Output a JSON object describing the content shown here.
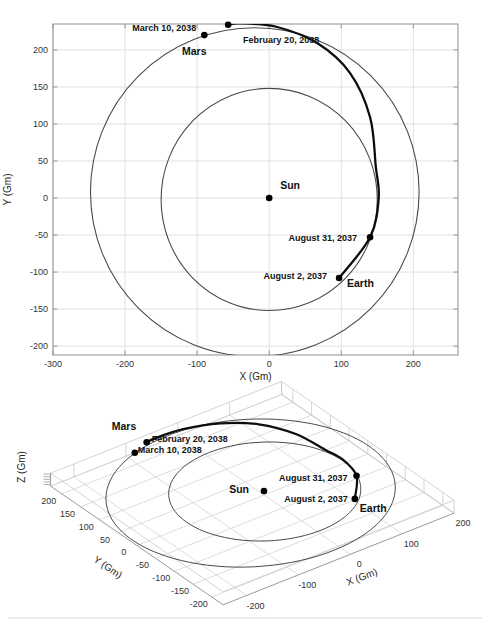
{
  "window": {
    "width": 490,
    "height": 625,
    "background": "#ffffff"
  },
  "colors": {
    "grid2d": "#dcdcdc",
    "axis2d": "#8f8f8f",
    "orbit": "#4a4a4a",
    "transfer": "#0d0d0d",
    "marker": "#000000",
    "grid3d": "#d4d4d4",
    "box3d_back": "#bdbdbd",
    "box3d_front": "#9a9a9a",
    "comb3d": "#c9c9c9",
    "page_shadow": "#e0e0e0"
  },
  "chart_data": [
    {
      "id": "orbit-plot-2d",
      "type": "line",
      "projection": "2d",
      "description": "Earth-to-Mars transfer trajectory, ecliptic plane view",
      "xlabel": "X (Gm)",
      "ylabel": "Y (Gm)",
      "xlim": [
        -300,
        262
      ],
      "ylim": [
        -212,
        235
      ],
      "xticks": [
        -300,
        -200,
        -100,
        0,
        100,
        200
      ],
      "yticks": [
        -200,
        -150,
        -100,
        -50,
        0,
        50,
        100,
        150,
        200
      ],
      "grid": true,
      "series": [
        {
          "name": "Earth orbit",
          "shape": "ellipse",
          "cx": 0,
          "cy": -2,
          "rx": 150,
          "ry": 150,
          "width": 1.1
        },
        {
          "name": "Mars orbit",
          "shape": "ellipse",
          "cx": -20,
          "cy": 8,
          "rx": 228,
          "ry": 222,
          "width": 1.1
        },
        {
          "name": "Transfer trajectory",
          "shape": "path",
          "width": 2.3,
          "points": [
            [
              97,
              -108
            ],
            [
              140,
              -53
            ],
            [
              152,
              0
            ],
            [
              148,
              42
            ],
            [
              140,
              109
            ],
            [
              112,
              169
            ],
            [
              67,
              209
            ],
            [
              11,
              231
            ],
            [
              -40,
              236
            ],
            [
              -57,
              234
            ]
          ]
        }
      ],
      "annotations": [
        {
          "label": "Sun",
          "x": 0,
          "y": 0,
          "marker": true,
          "anchor": "start",
          "dx": 11,
          "dy": -12,
          "cls": "planet-label"
        },
        {
          "label": "Earth",
          "x": 108,
          "y": -116,
          "marker": false,
          "anchor": "start",
          "dx": 0,
          "dy": 0,
          "cls": "planet-label"
        },
        {
          "label": "Mars",
          "x": -121,
          "y": 197,
          "marker": false,
          "anchor": "start",
          "dx": 0,
          "dy": 0,
          "cls": "planet-label"
        },
        {
          "label": "March 10, 2038",
          "x": -90,
          "y": 220,
          "marker": true,
          "anchor": "end",
          "dx": -8,
          "dy": -6,
          "cls": "date-label"
        },
        {
          "label": "February 20, 2038",
          "x": -57,
          "y": 234,
          "marker": true,
          "anchor": "start",
          "dx": 15,
          "dy": 16,
          "cls": "date-label"
        },
        {
          "label": "August 31, 2037",
          "x": 140,
          "y": -53,
          "marker": true,
          "anchor": "end",
          "dx": -13,
          "dy": 1,
          "cls": "date-label"
        },
        {
          "label": "August 2, 2037",
          "x": 97,
          "y": -108,
          "marker": true,
          "anchor": "end",
          "dx": -12,
          "dy": -1,
          "cls": "date-label"
        }
      ]
    },
    {
      "id": "orbit-plot-3d",
      "type": "line",
      "projection": "3d",
      "description": "Earth-to-Mars transfer trajectory, 3-D view",
      "xlabel": "X (Gm)",
      "ylabel": "Y (Gm)",
      "zlabel": "Z (Gm)",
      "xlim": [
        -245,
        200
      ],
      "ylim": [
        -230,
        230
      ],
      "xticks": [
        -200,
        -100,
        0,
        100,
        200
      ],
      "yticks": [
        -200,
        -150,
        -100,
        -50,
        0,
        50,
        100,
        150,
        200
      ],
      "grid": true,
      "series": [
        {
          "name": "Earth orbit",
          "shape": "ellipse",
          "cx": 0,
          "cy": -2,
          "rx": 150,
          "ry": 150,
          "width": 1.0
        },
        {
          "name": "Mars orbit",
          "shape": "ellipse",
          "cx": -20,
          "cy": 8,
          "rx": 228,
          "ry": 222,
          "width": 1.0
        },
        {
          "name": "Transfer trajectory",
          "shape": "path",
          "width": 2.2,
          "points": [
            [
              97,
              -108
            ],
            [
              140,
              -53
            ],
            [
              152,
              0
            ],
            [
              148,
              42
            ],
            [
              140,
              109
            ],
            [
              112,
              169
            ],
            [
              67,
              209
            ],
            [
              11,
              231
            ],
            [
              -40,
              236
            ],
            [
              -57,
              234
            ]
          ]
        }
      ],
      "annotations": [
        {
          "label": "Sun",
          "x": 0,
          "y": 0,
          "marker": true,
          "anchor": "end",
          "dx": -15,
          "dy": -1,
          "cls": "planet-label"
        },
        {
          "label": "Earth",
          "x": 97,
          "y": -108,
          "marker": false,
          "anchor": "start",
          "dx": 5,
          "dy": 10,
          "cls": "planet-label"
        },
        {
          "label": "Mars",
          "x": -90,
          "y": 220,
          "marker": false,
          "anchor": "start",
          "dx": -23,
          "dy": -26,
          "cls": "planet-label"
        },
        {
          "label": "February 20, 2038",
          "x": -57,
          "y": 234,
          "marker": true,
          "anchor": "start",
          "dx": 5,
          "dy": -3,
          "cls": "date-label"
        },
        {
          "label": "March 10, 2038",
          "x": -90,
          "y": 220,
          "marker": true,
          "anchor": "start",
          "dx": 3,
          "dy": -2,
          "cls": "date-label"
        },
        {
          "label": "August 31, 2037",
          "x": 140,
          "y": -53,
          "marker": true,
          "anchor": "end",
          "dx": -9,
          "dy": 3,
          "cls": "date-label"
        },
        {
          "label": "August 2, 2037",
          "x": 97,
          "y": -108,
          "marker": true,
          "anchor": "end",
          "dx": -7,
          "dy": 1,
          "cls": "date-label"
        }
      ]
    }
  ]
}
